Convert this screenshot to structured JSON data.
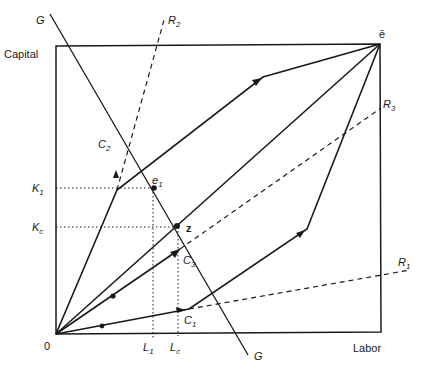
{
  "axes": {
    "y_label": "Capital",
    "x_label": "Labor",
    "origin_label": "0",
    "corner_label": "ē"
  },
  "lines": {
    "G_top": "G",
    "G_bottom": "G",
    "R1": {
      "base": "R",
      "sub": "1"
    },
    "R2": {
      "base": "R",
      "sub": "2"
    },
    "R3": {
      "base": "R",
      "sub": "3"
    }
  },
  "paths": {
    "C1": {
      "base": "C",
      "sub": "1"
    },
    "C2": {
      "base": "C",
      "sub": "2"
    },
    "C3": {
      "base": "C",
      "sub": "3"
    }
  },
  "points": {
    "e1": {
      "base": "e",
      "sub": "1"
    },
    "z": "z"
  },
  "ticks": {
    "K1": {
      "base": "K",
      "sub": "1"
    },
    "Kc": {
      "base": "K",
      "sub": "c"
    },
    "L1": {
      "base": "L",
      "sub": "1"
    },
    "Lc": {
      "base": "L",
      "sub": "c"
    }
  },
  "colors": {
    "ink": "#1a1a1a",
    "background": "#ffffff"
  }
}
